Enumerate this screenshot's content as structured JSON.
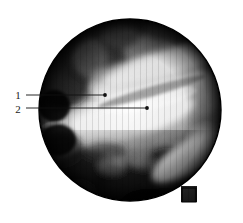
{
  "figure": {
    "kind": "endoscopic-photograph",
    "background_color": "#ffffff",
    "field_of_view": {
      "shape": "circle-with-notch",
      "center_x": 130,
      "center_y": 110,
      "radius": 92,
      "rim_color": "#000000",
      "notch": {
        "description": "small rectangular tab protruding at lower-right of circular field",
        "x": 182,
        "y": 188,
        "width": 14,
        "height": 14
      }
    },
    "tones": {
      "darkest": "#0a0a0a",
      "dark": "#2e2e2e",
      "mid": "#8a8a8a",
      "light": "#d8d8d8",
      "brightest": "#ffffff"
    },
    "annotations": [
      {
        "id": "annotation-1",
        "label": "1",
        "label_x": 18,
        "label_y": 95,
        "line_start_x": 26,
        "line_start_y": 93,
        "line_end_x": 105,
        "line_end_y": 95,
        "dot_x": 105,
        "dot_y": 95,
        "dot_radius": 1.8,
        "line_color": "#111111"
      },
      {
        "id": "annotation-2",
        "label": "2",
        "label_x": 18,
        "label_y": 110,
        "line_start_x": 26,
        "line_start_y": 106,
        "line_end_x": 147,
        "line_end_y": 106,
        "dot_x": 147,
        "dot_y": 106,
        "dot_radius": 1.8,
        "line_color": "#111111"
      }
    ]
  }
}
